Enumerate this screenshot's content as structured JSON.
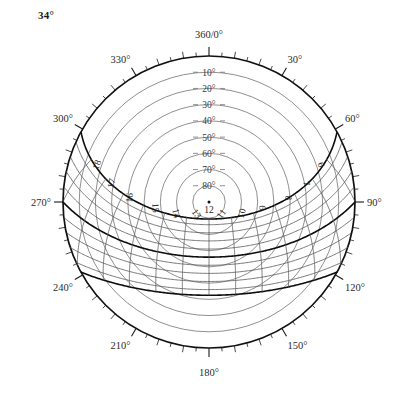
{
  "title": {
    "latitude_label": "34°"
  },
  "chart_data": {
    "type": "line",
    "chart_kind": "sun-path-polar-diagram",
    "projection": "equidistant-azimuthal",
    "title": "34°",
    "xlabel": "Azimuth",
    "ylabel": "Altitude",
    "latitude_deg": 34,
    "grid": true,
    "legend": "none",
    "center": {
      "cx": 209,
      "cy": 202,
      "r": 146
    },
    "azimuth_axis": {
      "range": [
        0,
        360
      ],
      "major_tick_step": 30,
      "minor_tick_step": 5,
      "zero_at": "top",
      "direction": "clockwise",
      "labels": [
        {
          "value": 0,
          "text": "360/0°"
        },
        {
          "value": 30,
          "text": "30°"
        },
        {
          "value": 60,
          "text": "60°"
        },
        {
          "value": 90,
          "text": "90°"
        },
        {
          "value": 120,
          "text": "120°"
        },
        {
          "value": 150,
          "text": "150°"
        },
        {
          "value": 180,
          "text": "180°"
        },
        {
          "value": 210,
          "text": "210°"
        },
        {
          "value": 240,
          "text": "240°"
        },
        {
          "value": 270,
          "text": "270°"
        },
        {
          "value": 300,
          "text": "300°"
        },
        {
          "value": 330,
          "text": "330°"
        }
      ]
    },
    "altitude_axis": {
      "range": [
        0,
        90
      ],
      "step": 10,
      "labels": [
        {
          "value": 10,
          "text": "10°"
        },
        {
          "value": 20,
          "text": "20°"
        },
        {
          "value": 30,
          "text": "30°"
        },
        {
          "value": 40,
          "text": "40°"
        },
        {
          "value": 50,
          "text": "50°"
        },
        {
          "value": 60,
          "text": "60°"
        },
        {
          "value": 70,
          "text": "70°"
        },
        {
          "value": 80,
          "text": "80°"
        }
      ]
    },
    "hour_lines": {
      "labels": [
        "6",
        "7",
        "8",
        "9",
        "10",
        "11",
        "12",
        "13",
        "14",
        "15",
        "16",
        "17",
        "18"
      ],
      "values": [
        6,
        7,
        8,
        9,
        10,
        11,
        12,
        13,
        14,
        15,
        16,
        17,
        18
      ]
    },
    "declination_curves": {
      "note": "sun paths for solar declinations; bold curves are solstices and equinox",
      "values_deg": [
        23.5,
        20,
        15,
        10,
        5,
        0,
        -5,
        -10,
        -15,
        -20,
        -23.5
      ],
      "bold_values_deg": [
        23.5,
        0,
        -23.5
      ]
    },
    "colors": {
      "horizon": "#111111",
      "altitude_circle": "#6b6b6b",
      "path_bold": "#0d0d0d",
      "path_thin": "#555555",
      "text": "#2b2b2b",
      "background": "#ffffff"
    }
  }
}
